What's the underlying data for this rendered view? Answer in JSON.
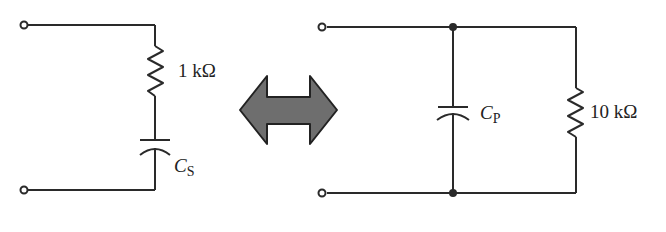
{
  "figure": {
    "left_circuit": {
      "resistor_label": "1 kΩ",
      "capacitor_symbol": "C",
      "capacitor_subscript": "S",
      "topology": "series"
    },
    "equivalence_arrow": {
      "fill": "#6e6e6e",
      "stroke": "#222222"
    },
    "right_circuit": {
      "resistor_label": "10 kΩ",
      "capacitor_symbol": "C",
      "capacitor_subscript": "P",
      "topology": "parallel"
    },
    "line_color": "#2a2a2a"
  }
}
